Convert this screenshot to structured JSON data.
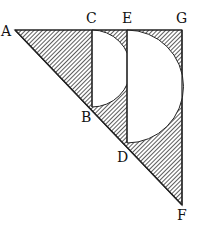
{
  "diagram": {
    "labels": {
      "A": "A",
      "B": "B",
      "C": "C",
      "D": "D",
      "E": "E",
      "F": "F",
      "G": "G"
    },
    "points": {
      "A": [
        15,
        30
      ],
      "C": [
        92,
        30
      ],
      "E": [
        127,
        30
      ],
      "G": [
        182,
        30
      ],
      "B": [
        92,
        107
      ],
      "D": [
        127,
        143
      ],
      "F": [
        182,
        205
      ]
    },
    "fill": "hatched",
    "stroke_color": "#222222"
  }
}
